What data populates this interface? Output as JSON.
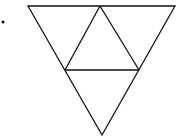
{
  "diagram": {
    "stroke_color": "#111111",
    "background": "#ffffff",
    "bullet": {
      "cx": 3,
      "cy": 22,
      "r": 1.5
    },
    "outer_triangle": {
      "points": "28,6 175,6 102,135"
    },
    "inner_lines": [
      {
        "x1": 100,
        "y1": 6,
        "x2": 65,
        "y2": 70
      },
      {
        "x1": 100,
        "y1": 6,
        "x2": 139,
        "y2": 70
      },
      {
        "x1": 65,
        "y1": 70,
        "x2": 139,
        "y2": 70
      }
    ]
  }
}
